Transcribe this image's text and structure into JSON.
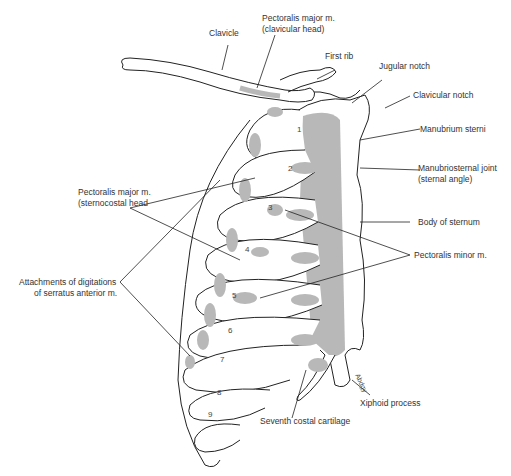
{
  "figure": {
    "colors": {
      "line": "#222222",
      "attachment_shading": "#b8b8b8",
      "background": "#ffffff",
      "label_text": "#333333"
    },
    "rib_numbers": [
      "1",
      "2",
      "3",
      "4",
      "5",
      "6",
      "7",
      "8",
      "9"
    ],
    "signature": "Abdgy"
  },
  "labels": {
    "clavicle": "Clavicle",
    "pec_major_clav_1": "Pectoralis major m.",
    "pec_major_clav_2": "(clavicular head)",
    "first_rib": "First rib",
    "jugular_notch": "Jugular notch",
    "clavicular_notch": "Clavicular notch",
    "manubrium": "Manubrium sterni",
    "manubriosternal_1": "Manubriosternal joint",
    "manubriosternal_2": "(sternal angle)",
    "pec_major_sterno_1": "Pectoralis major m.",
    "pec_major_sterno_2": "(sternocostal head",
    "body_sternum": "Body of sternum",
    "pec_minor": "Pectoralis minor m.",
    "serratus_1": "Attachments of digitations",
    "serratus_2": "of serratus anterior m.",
    "xiphoid": "Xiphoid process",
    "seventh_cartilage": "Seventh costal cartilage"
  }
}
